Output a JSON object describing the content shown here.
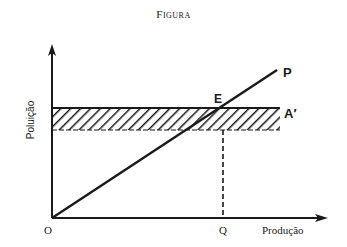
{
  "figure": {
    "title": "Figura",
    "y_axis_label": "Poluição",
    "x_axis_label": "Produção",
    "origin_label": "O",
    "q_label": "Q",
    "line_label": "P",
    "band_label": "A′",
    "intersection_label": "E"
  },
  "colors": {
    "ink": "#1a1a1a",
    "background": "#ffffff"
  }
}
